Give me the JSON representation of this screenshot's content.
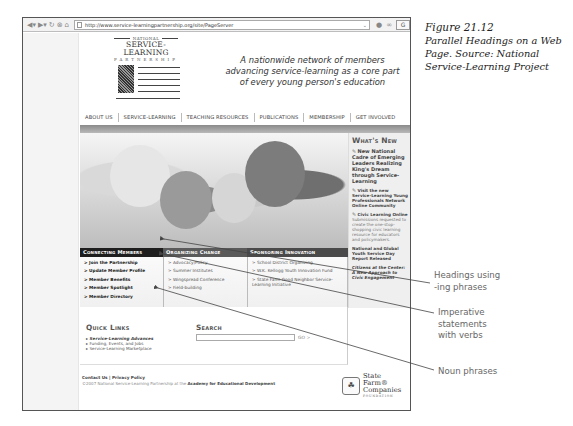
{
  "browser": {
    "url": "http://www.service-learningpartnership.org/site/PageServer",
    "toolbar_icons": [
      "back-icon",
      "forward-icon",
      "reload-icon",
      "stop-icon",
      "home-icon"
    ],
    "go_icons": [
      "dropdown-icon",
      "go-icon",
      "bookmark-icon",
      "search-engine-icon"
    ]
  },
  "site": {
    "logo": {
      "national": "NATIONAL",
      "name": "SERVICE-LEARNING",
      "partnership": "PARTNERSHIP"
    },
    "tagline": [
      "A nationwide network of members",
      "advancing service-learning as a core part",
      "of every young person's education"
    ],
    "nav": [
      "ABOUT US",
      "SERVICE-LEARNING",
      "TEACHING RESOURCES",
      "PUBLICATIONS",
      "MEMBERSHIP",
      "GET INVOLVED"
    ],
    "whats_new": {
      "title": "What's New",
      "items": [
        {
          "head": "New National Cadre of Emerging Leaders Realizing King's Dream through Service-Learning",
          "desc": ""
        },
        {
          "head": "Visit the new Service-Learning Young Professionals Network Online Community",
          "desc": ""
        },
        {
          "head": "Civic Learning Online",
          "desc": "Submissions requested to create the one-stop-shopping civic learning resource for educators and policymakers."
        },
        {
          "head": "National and Global Youth Service Day Report Released",
          "desc": ""
        },
        {
          "head": "Citizens at the Center: A New Approach to Civic Engagement",
          "desc": ""
        }
      ]
    },
    "columns": [
      {
        "header": "Connecting Members",
        "links": [
          "> Join the Partnership",
          "> Update Member Profile",
          "> Member Benefits",
          "> Member Spotlight",
          "> Member Directory"
        ]
      },
      {
        "header": "Organizing Change",
        "links": [
          "> Advocacy/Policy",
          "> Summer Institutes",
          "> Wingspread Conference",
          "> Field-building"
        ]
      },
      {
        "header": "Sponsoring Innovation",
        "links": [
          "> School District Organizing",
          "> W.K. Kellogg Youth Innovation Fund",
          "> State Farm Good Neighbor Service-Learning Initiative"
        ]
      }
    ],
    "quick_links": {
      "title": "Quick Links",
      "items": [
        "Service-Learning Advances",
        "Funding, Events, and Jobs",
        "Service-Learning Marketplace"
      ]
    },
    "search": {
      "title": "Search",
      "value": "",
      "go": "GO >"
    },
    "footer": {
      "contact": "Contact Us",
      "sep": " | ",
      "privacy": "Privacy Policy",
      "copyright": "©2007 National Service-Learning Partnership at the ",
      "org": "Academy for Educational Development"
    },
    "sponsor": {
      "line1": "State Farm®",
      "line2": "Companies",
      "line3": "FOUNDATION"
    }
  },
  "caption": {
    "figure": "Figure 21.12",
    "text": "Parallel Headings on a Web Page. Source: National Service-Learning Project"
  },
  "annotations": [
    {
      "label_1": "Headings using",
      "label_2": "-ing phrases"
    },
    {
      "label_1": "Imperative",
      "label_2": "statements",
      "label_3": "with verbs"
    },
    {
      "label_1": "Noun phrases"
    }
  ]
}
